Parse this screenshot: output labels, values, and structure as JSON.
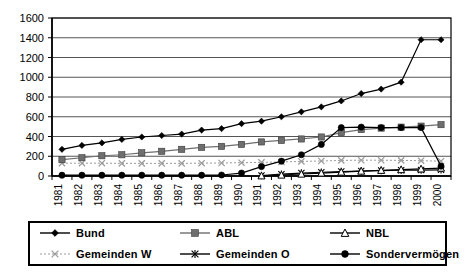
{
  "chart_data": {
    "type": "line",
    "title": "",
    "xlabel": "",
    "ylabel": "",
    "ylim": [
      0,
      1600
    ],
    "ytick_step": 200,
    "yticks": [
      0,
      200,
      400,
      600,
      800,
      1000,
      1200,
      1400,
      1600
    ],
    "grid": true,
    "legend_position": "bottom",
    "categories": [
      "1981",
      "1982",
      "1983",
      "1984",
      "1985",
      "1986",
      "1987",
      "1988",
      "1989",
      "1990",
      "1991",
      "1992",
      "1993",
      "1994",
      "1995",
      "1996",
      "1997",
      "1998",
      "1999",
      "2000"
    ],
    "series": [
      {
        "name": "Bund",
        "marker": "diamond",
        "color": "#000000",
        "values": [
          270,
          310,
          335,
          370,
          395,
          410,
          425,
          465,
          480,
          530,
          555,
          600,
          650,
          700,
          760,
          835,
          880,
          950,
          1380,
          1380
        ]
      },
      {
        "name": "ABL",
        "marker": "square",
        "color": "#6e6e6e",
        "values": [
          165,
          185,
          205,
          215,
          235,
          250,
          270,
          290,
          300,
          320,
          345,
          360,
          375,
          395,
          440,
          470,
          485,
          495,
          505,
          520
        ]
      },
      {
        "name": "NBL",
        "marker": "triangle-open",
        "color": "#000000",
        "values": [
          null,
          null,
          null,
          null,
          null,
          null,
          null,
          null,
          null,
          null,
          2,
          10,
          20,
          30,
          40,
          50,
          58,
          65,
          72,
          80
        ]
      },
      {
        "name": "Gemeinden W",
        "marker": "x",
        "color": "#9a9a9a",
        "values": [
          130,
          130,
          130,
          128,
          128,
          128,
          128,
          130,
          132,
          135,
          138,
          142,
          148,
          152,
          158,
          160,
          160,
          158,
          155,
          150
        ]
      },
      {
        "name": "Gemeinden O",
        "marker": "asterisk",
        "color": "#000000",
        "values": [
          null,
          null,
          null,
          null,
          null,
          null,
          null,
          null,
          null,
          null,
          5,
          18,
          30,
          38,
          45,
          50,
          55,
          58,
          60,
          62
        ]
      },
      {
        "name": "Sondervermögen",
        "marker": "circle",
        "color": "#000000",
        "values": [
          8,
          8,
          8,
          8,
          8,
          8,
          8,
          8,
          10,
          30,
          95,
          150,
          215,
          320,
          490,
          495,
          490,
          490,
          490,
          100
        ]
      }
    ]
  },
  "legend": {
    "entries": [
      {
        "label": "Bund",
        "marker": "diamond"
      },
      {
        "label": "ABL",
        "marker": "square"
      },
      {
        "label": "NBL",
        "marker": "triangle-open"
      },
      {
        "label": "Gemeinden W",
        "marker": "x"
      },
      {
        "label": "Gemeinden O",
        "marker": "asterisk"
      },
      {
        "label": "Sondervermögen",
        "marker": "circle"
      }
    ]
  },
  "colors": {
    "axis": "#000000",
    "grid": "#555555",
    "series_dark": "#000000",
    "series_gray": "#6e6e6e",
    "series_light": "#9a9a9a",
    "background": "#ffffff"
  }
}
